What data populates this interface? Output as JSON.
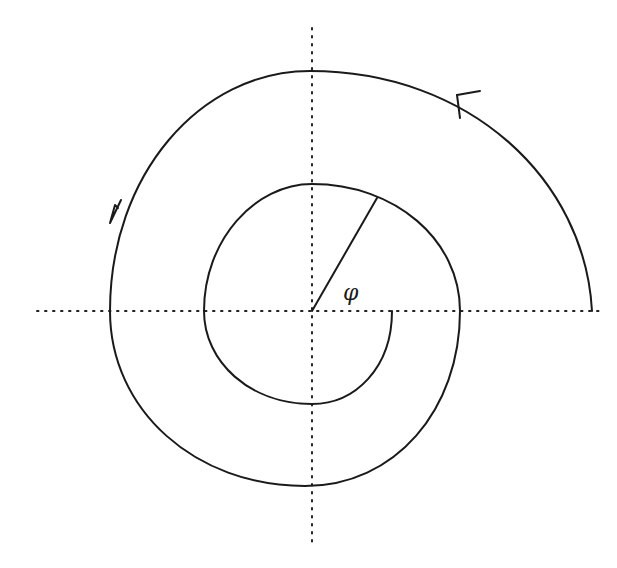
{
  "diagram": {
    "type": "spiral",
    "center": [
      312,
      311
    ],
    "angle_label": "φ",
    "axes": {
      "horizontal": {
        "x1": 37,
        "x2": 600,
        "y": 311
      },
      "vertical": {
        "x": 312,
        "y1": 28,
        "y2": 542
      }
    },
    "spiral": {
      "start": [
        392,
        311
      ],
      "end": [
        592,
        311
      ],
      "waypoints": [
        [
          392,
          311
        ],
        [
          312,
          404
        ],
        [
          204,
          311
        ],
        [
          312,
          184
        ],
        [
          460,
          311
        ],
        [
          312,
          486
        ],
        [
          110,
          311
        ],
        [
          310,
          71
        ],
        [
          592,
          311
        ]
      ]
    },
    "radius_line": {
      "from": [
        312,
        311
      ],
      "to": [
        377,
        198
      ]
    },
    "arrows": [
      {
        "position": [
          459,
          90
        ],
        "direction": "counterclockwise"
      },
      {
        "position": [
          112,
          218
        ],
        "direction": "counterclockwise"
      }
    ],
    "colors": {
      "stroke": "#1a1a1a",
      "background": "#ffffff"
    }
  }
}
